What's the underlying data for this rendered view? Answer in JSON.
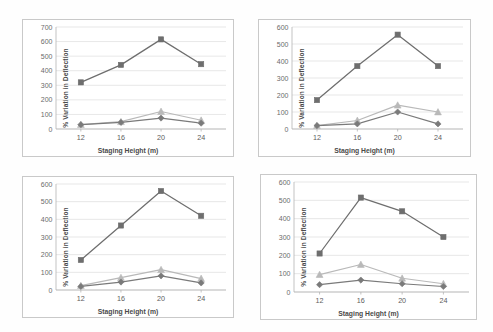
{
  "figure": {
    "background": "#ffffff",
    "panel_border_color": "#c9c9c9",
    "grid_color": "#dcdcdc",
    "axis_color": "#b4b4b4"
  },
  "series_styles": [
    {
      "name": "series-1",
      "marker": "square",
      "color": "#6e6e6e",
      "line_color": "#6e6e6e"
    },
    {
      "name": "series-2",
      "marker": "triangle",
      "color": "#b9b9b9",
      "line_color": "#b9b9b9"
    },
    {
      "name": "series-3",
      "marker": "diamond",
      "color": "#7a7a7a",
      "line_color": "#7a7a7a"
    }
  ],
  "chart_data": [
    {
      "id": "chart-top-left",
      "type": "line",
      "title": "",
      "xlabel": "Staging Height (m)",
      "ylabel": "% Variation  in Deflection",
      "categories": [
        "12",
        "16",
        "20",
        "24"
      ],
      "x": [
        12,
        16,
        20,
        24
      ],
      "ylim": [
        0,
        700
      ],
      "yticks": [
        0,
        100,
        200,
        300,
        400,
        500,
        600,
        700
      ],
      "ytick_labels": [
        "0",
        "100",
        "200",
        "300",
        "400",
        "500",
        "600",
        "700"
      ],
      "grid": true,
      "legend": "none",
      "series": [
        {
          "name": "series-1",
          "marker": "square",
          "values": [
            320,
            440,
            615,
            445
          ]
        },
        {
          "name": "series-2",
          "marker": "triangle",
          "values": [
            30,
            50,
            120,
            60
          ]
        },
        {
          "name": "series-3",
          "marker": "diamond",
          "values": [
            30,
            45,
            75,
            40
          ]
        }
      ]
    },
    {
      "id": "chart-top-right",
      "type": "line",
      "title": "",
      "xlabel": "Staging Height (m)",
      "ylabel": "% Variation  in Deflection",
      "categories": [
        "12",
        "16",
        "20",
        "24"
      ],
      "x": [
        12,
        16,
        20,
        24
      ],
      "ylim": [
        0,
        600
      ],
      "yticks": [
        0,
        100,
        200,
        300,
        400,
        500,
        600
      ],
      "ytick_labels": [
        "0",
        "100",
        "200",
        "300",
        "400",
        "500",
        "600"
      ],
      "grid": true,
      "legend": "none",
      "series": [
        {
          "name": "series-1",
          "marker": "square",
          "values": [
            170,
            370,
            555,
            370
          ]
        },
        {
          "name": "series-2",
          "marker": "triangle",
          "values": [
            20,
            50,
            140,
            100
          ]
        },
        {
          "name": "series-3",
          "marker": "diamond",
          "values": [
            20,
            30,
            100,
            30
          ]
        }
      ]
    },
    {
      "id": "chart-bottom-left",
      "type": "line",
      "title": "",
      "xlabel": "Staging Height (m)",
      "ylabel": "% Variation  in Deflection",
      "categories": [
        "12",
        "16",
        "20",
        "24"
      ],
      "x": [
        12,
        16,
        20,
        24
      ],
      "ylim": [
        0,
        600
      ],
      "yticks": [
        0,
        100,
        200,
        300,
        400,
        500,
        600
      ],
      "ytick_labels": [
        "0",
        "100",
        "200",
        "300",
        "400",
        "500",
        "600"
      ],
      "grid": true,
      "legend": "none",
      "series": [
        {
          "name": "series-1",
          "marker": "square",
          "values": [
            170,
            365,
            560,
            420
          ]
        },
        {
          "name": "series-2",
          "marker": "triangle",
          "values": [
            25,
            70,
            115,
            65
          ]
        },
        {
          "name": "series-3",
          "marker": "diamond",
          "values": [
            20,
            45,
            80,
            40
          ]
        }
      ]
    },
    {
      "id": "chart-bottom-right",
      "type": "line",
      "title": "",
      "xlabel": "Staging Height (m)",
      "ylabel": "% Variation  in Deflection",
      "categories": [
        "12",
        "16",
        "20",
        "24"
      ],
      "x": [
        12,
        16,
        20,
        24
      ],
      "ylim": [
        0,
        600
      ],
      "yticks": [
        0,
        100,
        200,
        300,
        400,
        500,
        600
      ],
      "ytick_labels": [
        "0",
        "100",
        "200",
        "300",
        "400",
        "500",
        "600"
      ],
      "grid": true,
      "legend": "none",
      "series": [
        {
          "name": "series-1",
          "marker": "square",
          "values": [
            210,
            515,
            440,
            300
          ]
        },
        {
          "name": "series-2",
          "marker": "triangle",
          "values": [
            95,
            150,
            75,
            45
          ]
        },
        {
          "name": "series-3",
          "marker": "diamond",
          "values": [
            40,
            65,
            45,
            30
          ]
        }
      ]
    }
  ]
}
